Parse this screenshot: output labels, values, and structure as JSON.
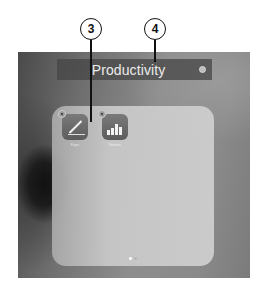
{
  "folder": {
    "title": "Productivity",
    "clear_button": "clear-title",
    "apps": [
      {
        "name": "Pages",
        "icon": "pages-pen-icon"
      },
      {
        "name": "Numbers",
        "icon": "numbers-bar-chart-icon"
      }
    ],
    "page_indicator": {
      "pages": 2,
      "current": 1
    }
  },
  "callouts": [
    {
      "number": "3",
      "target": "app-icon-delete-badge"
    },
    {
      "number": "4",
      "target": "folder-title"
    }
  ],
  "colors": {
    "callout_stroke": "#111111",
    "title_bar": "#464646",
    "folder_panel": "#cccccc"
  }
}
